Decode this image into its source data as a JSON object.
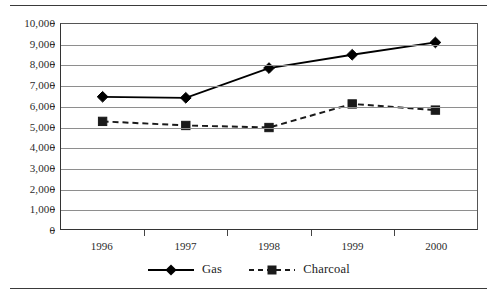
{
  "chart_data": {
    "type": "line",
    "title": "",
    "subtitle": "",
    "xlabel": "",
    "ylabel": "",
    "categories": [
      "1996",
      "1997",
      "1998",
      "1999",
      "2000"
    ],
    "x": [
      1996,
      1997,
      1998,
      1999,
      2000
    ],
    "ylim": [
      0,
      10000
    ],
    "ytick_labels": [
      "10,000",
      "9,000",
      "8,000",
      "7,000",
      "6,000",
      "5,000",
      "4,000",
      "3,000",
      "2,000",
      "1,000",
      "0"
    ],
    "ytick_values": [
      10000,
      9000,
      8000,
      7000,
      6000,
      5000,
      4000,
      3000,
      2000,
      1000,
      0
    ],
    "xtick_labels": [
      "1996",
      "1997",
      "1998",
      "1999",
      "2000"
    ],
    "grid": true,
    "grid_axis": "y",
    "legend_position": "bottom-center",
    "series": [
      {
        "name": "Gas",
        "values": [
          6450,
          6400,
          7850,
          8500,
          9100
        ],
        "marker": "diamond",
        "line_style": "solid",
        "color": "#000000"
      },
      {
        "name": "Charcoal",
        "values": [
          5250,
          5050,
          4950,
          6100,
          5800
        ],
        "marker": "square",
        "line_style": "dashed",
        "color": "#1a1a1a"
      }
    ]
  },
  "legend": {
    "entries": [
      {
        "label": "Gas",
        "marker": "diamond-marker",
        "style": "solid"
      },
      {
        "label": "Charcoal",
        "marker": "square-marker",
        "style": "dashed"
      }
    ]
  },
  "colors": {
    "series_gas": "#000000",
    "series_charcoal": "#1a1a1a",
    "gridline": "#8e8e8e",
    "axis": "#333333",
    "text": "#2b2b2b",
    "background": "#ffffff"
  }
}
